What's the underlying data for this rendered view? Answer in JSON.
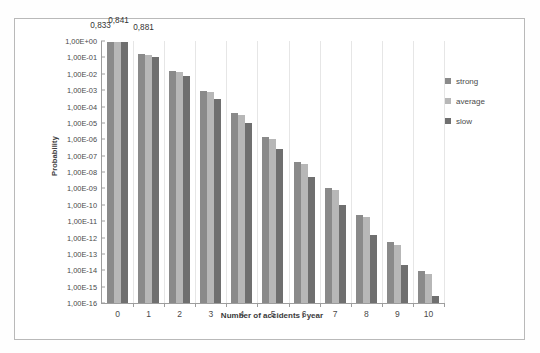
{
  "chart_data": {
    "type": "bar",
    "title": "",
    "xlabel": "Number of accidents / year",
    "ylabel": "Probability",
    "yscale": "log",
    "ylim": [
      1e-16,
      1
    ],
    "grid": false,
    "legend_position": "right",
    "categories": [
      "0",
      "1",
      "2",
      "3",
      "4",
      "5",
      "6",
      "7",
      "8",
      "9",
      "10"
    ],
    "ytick_labels": [
      "1,00E+00",
      "1,00E-01",
      "1,00E-02",
      "1,00E-03",
      "1,00E-04",
      "1,00E-05",
      "1,00E-06",
      "1,00E-07",
      "1,00E-08",
      "1,00E-09",
      "1,00E-10",
      "1,00E-11",
      "1,00E-12",
      "1,00E-13",
      "1,00E-14",
      "1,00E-15",
      "1,00E-16"
    ],
    "ytick_values": [
      1,
      0.1,
      0.01,
      0.001,
      0.0001,
      1e-05,
      1e-06,
      1e-07,
      1e-08,
      1e-09,
      1e-10,
      1e-11,
      1e-12,
      1e-13,
      1e-14,
      1e-15,
      1e-16
    ],
    "series": [
      {
        "name": "strong",
        "color": "#8a8a8a",
        "values": [
          0.833,
          0.152,
          0.014,
          0.00085,
          3.9e-05,
          1.4e-06,
          4.3e-08,
          1.1e-09,
          2.5e-11,
          5e-13,
          9.1e-15
        ]
      },
      {
        "name": "average",
        "color": "#b7b7b7",
        "values": [
          0.841,
          0.146,
          0.0127,
          0.00073,
          3.2e-05,
          1.1e-06,
          3.2e-08,
          7.9e-10,
          1.7e-11,
          3.3e-13,
          5.7e-15
        ]
      },
      {
        "name": "slow",
        "color": "#6f6f6f",
        "values": [
          0.881,
          0.112,
          0.0071,
          0.0003,
          9.5e-06,
          2.4e-07,
          5.1e-09,
          9.2e-11,
          1.5e-12,
          2.1e-14,
          2.6e-16
        ]
      }
    ],
    "data_labels": [
      {
        "text": "0,833",
        "category": "0",
        "series": "strong"
      },
      {
        "text": "0,841",
        "category": "0",
        "series": "average"
      },
      {
        "text": "0,881",
        "category": "0",
        "series": "slow"
      }
    ]
  },
  "legend": {
    "items": [
      {
        "label": "strong"
      },
      {
        "label": "average"
      },
      {
        "label": "slow"
      }
    ]
  }
}
